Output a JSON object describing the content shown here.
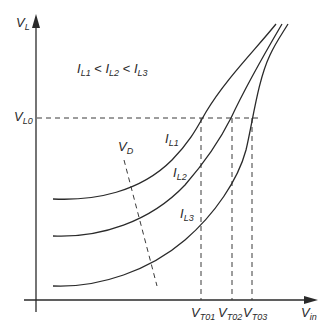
{
  "diagram": {
    "type": "characteristic-curves",
    "y_axis": {
      "label_main": "V",
      "label_sub": "L"
    },
    "x_axis": {
      "label_main": "V",
      "label_sub": "in"
    },
    "condition": {
      "parts": [
        {
          "main": "I",
          "sub": "L1"
        },
        {
          "op": "<"
        },
        {
          "main": "I",
          "sub": "L2"
        },
        {
          "op": "<"
        },
        {
          "main": "I",
          "sub": "L3"
        }
      ]
    },
    "level_line": {
      "label_main": "V",
      "label_sub": "L0"
    },
    "drain_line": {
      "label_main": "V",
      "label_sub": "D"
    },
    "curves": [
      {
        "name": "IL1",
        "label_main": "I",
        "label_sub": "L1"
      },
      {
        "name": "IL2",
        "label_main": "I",
        "label_sub": "L2"
      },
      {
        "name": "IL3",
        "label_main": "I",
        "label_sub": "L3"
      }
    ],
    "thresholds": [
      {
        "label_main": "V",
        "label_sub": "T01"
      },
      {
        "label_main": "V",
        "label_sub": "T02"
      },
      {
        "label_main": "V",
        "label_sub": "T03"
      }
    ],
    "colors": {
      "ink": "#2a2a2a",
      "background": "#ffffff"
    }
  }
}
